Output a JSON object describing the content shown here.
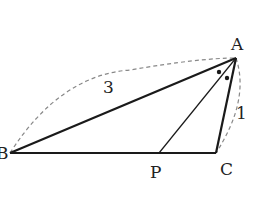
{
  "figure": {
    "type": "geometry-triangle",
    "top_cropped_text": "",
    "points": {
      "A": {
        "label": "A",
        "x": 236,
        "y": 58
      },
      "B": {
        "label": "B",
        "x": 10,
        "y": 153
      },
      "C": {
        "label": "C",
        "x": 216,
        "y": 153
      },
      "P": {
        "label": "P",
        "x": 159,
        "y": 153
      }
    },
    "lengths": {
      "AB": "3",
      "AC": "1"
    },
    "angle_marks": "equal angles BAP and PAC marked with dots",
    "colors": {
      "line": "#1a1a1a",
      "dashed": "#888888",
      "text": "#222222"
    }
  }
}
